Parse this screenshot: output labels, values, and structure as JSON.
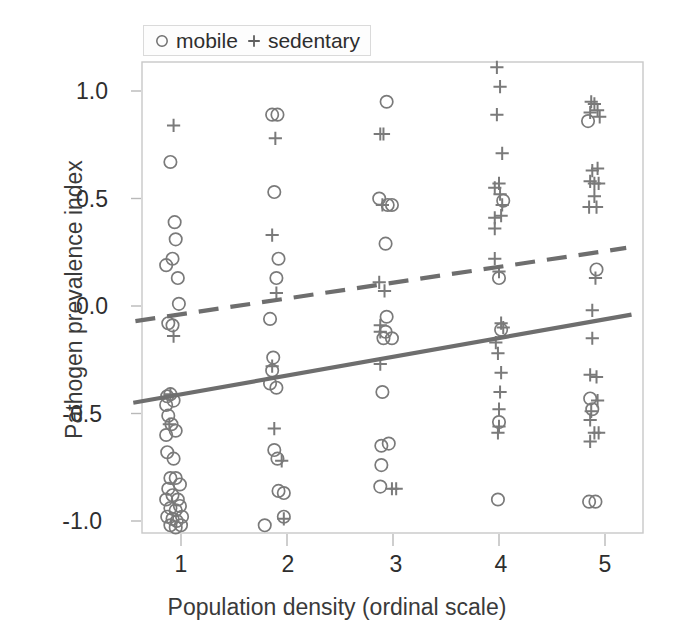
{
  "chart_data": {
    "type": "scatter",
    "title": "",
    "xlabel": "Population density (ordinal scale)",
    "ylabel": "Pathogen prevalence index",
    "xlim": [
      0.55,
      5.45
    ],
    "ylim": [
      -1.12,
      1.18
    ],
    "xticks": [
      1,
      2,
      3,
      4,
      5
    ],
    "xticklabels": [
      "1",
      "2",
      "3",
      "4",
      "5"
    ],
    "yticks": [
      1.0,
      0.5,
      0.0,
      -0.5,
      -1.0
    ],
    "yticklabels": [
      "1.0",
      "0.5",
      "0.0",
      "-0.5",
      "-1.0"
    ],
    "grid": false,
    "legend_position": "top-left-outside",
    "marker_color": "#7a7a7a",
    "line_color": "#6e6e6e",
    "frame_color": "#c8c8c8",
    "legend": [
      {
        "label": "mobile",
        "marker": "circle"
      },
      {
        "label": "sedentary",
        "marker": "plus"
      }
    ],
    "series": [
      {
        "name": "mobile",
        "marker": "circle",
        "points": [
          [
            0.9,
            0.67
          ],
          [
            0.86,
            0.19
          ],
          [
            0.94,
            0.39
          ],
          [
            0.92,
            0.22
          ],
          [
            0.95,
            0.31
          ],
          [
            0.97,
            0.13
          ],
          [
            0.98,
            0.01
          ],
          [
            0.88,
            -0.08
          ],
          [
            0.92,
            -0.09
          ],
          [
            0.87,
            -0.42
          ],
          [
            0.9,
            -0.41
          ],
          [
            0.86,
            -0.46
          ],
          [
            0.93,
            -0.44
          ],
          [
            0.88,
            -0.51
          ],
          [
            0.91,
            -0.55
          ],
          [
            0.86,
            -0.6
          ],
          [
            0.95,
            -0.58
          ],
          [
            0.87,
            -0.68
          ],
          [
            0.93,
            -0.71
          ],
          [
            0.9,
            -0.8
          ],
          [
            0.95,
            -0.8
          ],
          [
            0.88,
            -0.85
          ],
          [
            0.99,
            -0.83
          ],
          [
            0.86,
            -0.9
          ],
          [
            0.92,
            -0.88
          ],
          [
            0.97,
            -0.9
          ],
          [
            0.9,
            -0.94
          ],
          [
            0.95,
            -0.95
          ],
          [
            0.99,
            -0.93
          ],
          [
            0.87,
            -0.98
          ],
          [
            0.92,
            -0.99
          ],
          [
            0.96,
            -1.0
          ],
          [
            1.01,
            -0.98
          ],
          [
            0.9,
            -1.02
          ],
          [
            0.95,
            -1.03
          ],
          [
            1.0,
            -1.02
          ],
          [
            1.86,
            0.89
          ],
          [
            1.91,
            0.89
          ],
          [
            1.88,
            0.53
          ],
          [
            1.92,
            0.22
          ],
          [
            1.9,
            0.13
          ],
          [
            1.84,
            -0.06
          ],
          [
            1.87,
            -0.24
          ],
          [
            1.86,
            -0.3
          ],
          [
            1.84,
            -0.36
          ],
          [
            1.9,
            -0.38
          ],
          [
            1.88,
            -0.67
          ],
          [
            1.91,
            -0.71
          ],
          [
            1.92,
            -0.86
          ],
          [
            1.97,
            -0.87
          ],
          [
            1.97,
            -0.98
          ],
          [
            1.79,
            -1.02
          ],
          [
            2.94,
            0.95
          ],
          [
            2.87,
            0.5
          ],
          [
            2.95,
            0.47
          ],
          [
            2.99,
            0.47
          ],
          [
            2.93,
            0.29
          ],
          [
            2.94,
            -0.05
          ],
          [
            2.93,
            -0.12
          ],
          [
            2.91,
            -0.15
          ],
          [
            2.99,
            -0.15
          ],
          [
            2.9,
            -0.4
          ],
          [
            2.89,
            -0.65
          ],
          [
            2.96,
            -0.64
          ],
          [
            2.89,
            -0.74
          ],
          [
            2.88,
            -0.84
          ],
          [
            4.04,
            0.49
          ],
          [
            4.0,
            0.13
          ],
          [
            4.02,
            -0.11
          ],
          [
            4.0,
            -0.54
          ],
          [
            3.99,
            -0.9
          ],
          [
            4.84,
            0.86
          ],
          [
            4.92,
            0.17
          ],
          [
            4.86,
            -0.43
          ],
          [
            4.88,
            -0.48
          ],
          [
            4.85,
            -0.91
          ],
          [
            4.91,
            -0.91
          ]
        ]
      },
      {
        "name": "sedentary",
        "marker": "plus",
        "points": [
          [
            0.93,
            0.84
          ],
          [
            0.93,
            -0.14
          ],
          [
            0.9,
            -0.41
          ],
          [
            0.89,
            -0.55
          ],
          [
            1.89,
            0.78
          ],
          [
            1.86,
            0.33
          ],
          [
            1.9,
            0.06
          ],
          [
            1.86,
            -0.28
          ],
          [
            1.88,
            -0.57
          ],
          [
            1.95,
            -0.72
          ],
          [
            1.97,
            -0.99
          ],
          [
            2.88,
            0.8
          ],
          [
            2.91,
            0.8
          ],
          [
            2.9,
            0.47
          ],
          [
            2.87,
            0.11
          ],
          [
            2.92,
            0.07
          ],
          [
            2.88,
            -0.09
          ],
          [
            2.88,
            -0.12
          ],
          [
            2.88,
            -0.27
          ],
          [
            2.99,
            -0.85
          ],
          [
            3.03,
            -0.85
          ],
          [
            3.98,
            1.11
          ],
          [
            4.01,
            1.02
          ],
          [
            3.98,
            0.89
          ],
          [
            4.03,
            0.71
          ],
          [
            3.96,
            0.55
          ],
          [
            4.0,
            0.57
          ],
          [
            4.01,
            0.52
          ],
          [
            4.03,
            0.47
          ],
          [
            3.96,
            0.41
          ],
          [
            4.02,
            0.42
          ],
          [
            3.96,
            0.36
          ],
          [
            3.96,
            0.22
          ],
          [
            4.0,
            0.16
          ],
          [
            4.02,
            -0.08
          ],
          [
            4.04,
            -0.1
          ],
          [
            3.97,
            -0.17
          ],
          [
            3.99,
            -0.22
          ],
          [
            4.02,
            -0.31
          ],
          [
            4.01,
            -0.4
          ],
          [
            4.0,
            -0.48
          ],
          [
            4.0,
            -0.56
          ],
          [
            3.99,
            -0.59
          ],
          [
            4.87,
            0.95
          ],
          [
            4.9,
            0.94
          ],
          [
            4.93,
            0.91
          ],
          [
            4.86,
            0.9
          ],
          [
            4.95,
            0.88
          ],
          [
            4.88,
            0.63
          ],
          [
            4.93,
            0.64
          ],
          [
            4.86,
            0.58
          ],
          [
            4.9,
            0.57
          ],
          [
            4.94,
            0.57
          ],
          [
            4.9,
            0.51
          ],
          [
            4.85,
            0.46
          ],
          [
            4.92,
            0.46
          ],
          [
            4.91,
            0.13
          ],
          [
            4.88,
            -0.02
          ],
          [
            4.88,
            -0.15
          ],
          [
            4.86,
            -0.32
          ],
          [
            4.92,
            -0.33
          ],
          [
            4.93,
            -0.44
          ],
          [
            4.87,
            -0.49
          ],
          [
            4.86,
            -0.53
          ],
          [
            4.9,
            -0.59
          ],
          [
            4.94,
            -0.59
          ],
          [
            4.86,
            -0.63
          ]
        ]
      }
    ],
    "trendlines": [
      {
        "name": "sedentary-trend",
        "style": "dashed",
        "x0": 0.57,
        "y0": -0.07,
        "x1": 5.2,
        "y1": 0.27
      },
      {
        "name": "mobile-trend",
        "style": "solid",
        "x0": 0.55,
        "y0": -0.45,
        "x1": 5.25,
        "y1": -0.04
      }
    ]
  },
  "axes": {
    "x_title": "Population density (ordinal scale)",
    "y_title": "Pathogen prevalence index"
  }
}
